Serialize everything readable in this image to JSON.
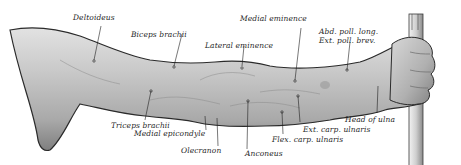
{
  "figure": {
    "top_caption_cropped": ""
  },
  "labels": [
    {
      "id": "deltoideus",
      "text": "Deltoideus",
      "x": 73,
      "y": 14
    },
    {
      "id": "biceps-brachii-top",
      "text": "Biceps brachii",
      "x": 131,
      "y": 31
    },
    {
      "id": "lateral-eminence",
      "text": "Lateral eminence",
      "x": 205,
      "y": 42
    },
    {
      "id": "medial-eminence",
      "text": "Medial eminence",
      "x": 240,
      "y": 15
    },
    {
      "id": "abd-poll-long",
      "text": "Abd. poll. long.",
      "x": 319,
      "y": 28
    },
    {
      "id": "ext-poll-brev",
      "text": "Ext. poll. brev.",
      "x": 319,
      "y": 37
    },
    {
      "id": "triceps-brachii",
      "text": "Triceps brachii",
      "x": 111,
      "y": 122
    },
    {
      "id": "medial-epicondyle",
      "text": "Medial epicondyle",
      "x": 134,
      "y": 130
    },
    {
      "id": "olecranon",
      "text": "Olecranon",
      "x": 181,
      "y": 147
    },
    {
      "id": "anconeus",
      "text": "Anconeus",
      "x": 245,
      "y": 150
    },
    {
      "id": "flex-carp-ulnaris",
      "text": "Flex. carp. ulnaris",
      "x": 272,
      "y": 136
    },
    {
      "id": "ext-carp-ulnaris",
      "text": "Ext. carp. ulnaris",
      "x": 303,
      "y": 126
    },
    {
      "id": "head-of-ulna",
      "text": "Head of ulna",
      "x": 345,
      "y": 116
    }
  ],
  "colors": {
    "skin_light": "#d4d4d4",
    "skin_mid": "#b3b3b3",
    "skin_dark": "#7d7d7d",
    "outline": "#2a2a2a",
    "label": "#1f1f1f",
    "background": "#ffffff"
  }
}
